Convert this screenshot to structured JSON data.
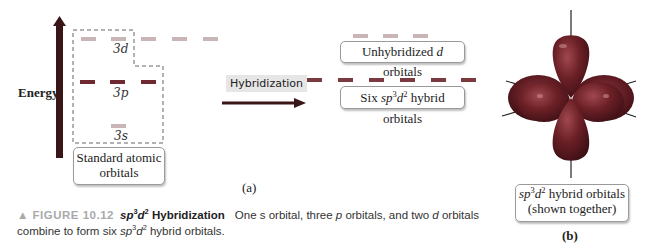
{
  "diagram_a": {
    "axis_label": "Energy",
    "orbitals_3d_label": "3d",
    "orbitals_3p_label": "3p",
    "orbitals_3s_label": "3s",
    "standard_box": {
      "line1": "Standard atomic",
      "line2": "orbitals"
    },
    "hybridization_label": "Hybridization",
    "unhybridized_box": {
      "prefix": "Unhybridized ",
      "italic": "d",
      "suffix": " orbitals"
    },
    "hybrid_box": {
      "prefix": "Six ",
      "sp": "sp",
      "sup1": "3",
      "d": "d",
      "sup2": "2",
      "suffix": " hybrid orbitals"
    },
    "panel_label": "(a)",
    "colors": {
      "d_orbital": "#c9b4b6",
      "p_orbital": "#6e2a30",
      "s_orbital": "#c9b4b6",
      "hybrid": "#7a3a40",
      "arrow": "#3a1518"
    }
  },
  "diagram_b": {
    "box": {
      "sp": "sp",
      "sup1": "3",
      "d": "d",
      "sup2": "2",
      "suffix": " hybrid orbitals",
      "line2": "(shown together)"
    },
    "panel_label": "(b)",
    "colors": {
      "lobe": "#6b2026",
      "lobe_highlight": "#a0474f"
    }
  },
  "caption": {
    "figure_number": "▲ FIGURE 10.12",
    "title_sp": "sp",
    "title_sup1": "3",
    "title_d": "d",
    "title_sup2": "2",
    "title_suffix": " Hybridization",
    "text_1": "One s orbital, three ",
    "text_p": "p",
    "text_2": " orbitals, and two ",
    "text_d": "d",
    "text_3": " orbitals",
    "text_4": "combine to form six ",
    "text_sp": "sp",
    "text_sup1": "3",
    "text_d2": "d",
    "text_sup2": "2",
    "text_5": " hybrid orbitals."
  }
}
